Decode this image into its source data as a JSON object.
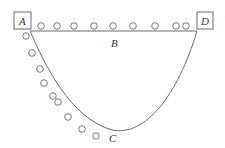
{
  "diagram": {
    "colors": {
      "stroke": "#6b6b6b",
      "text": "#333333",
      "background": "#ffffff"
    },
    "points": {
      "A": {
        "label": "A",
        "x": 23,
        "y": 20
      },
      "D": {
        "label": "D",
        "x": 205,
        "y": 20
      },
      "B": {
        "label": "B",
        "x": 115,
        "y": 47
      },
      "C": {
        "label": "C",
        "x": 113,
        "y": 140
      }
    },
    "straight_path": {
      "from": "A",
      "to": "D",
      "label": "B"
    },
    "curved_path": {
      "from": "A",
      "via": "C",
      "to": "D",
      "label": "C"
    },
    "balls_on_straight_path": {
      "count": 9,
      "positions": [
        [
          41,
          26
        ],
        [
          57,
          26
        ],
        [
          74,
          26
        ],
        [
          94,
          26
        ],
        [
          113,
          26
        ],
        [
          133,
          26
        ],
        [
          155,
          26
        ],
        [
          176,
          26
        ],
        [
          186,
          26
        ]
      ]
    },
    "balls_on_curved_path": {
      "count": 10,
      "positions": [
        [
          26,
          36
        ],
        [
          32,
          53
        ],
        [
          40,
          69
        ],
        [
          44,
          83
        ],
        [
          53,
          96
        ],
        [
          58,
          102
        ],
        [
          68,
          117
        ],
        [
          82,
          129
        ],
        [
          96,
          136
        ]
      ]
    }
  }
}
